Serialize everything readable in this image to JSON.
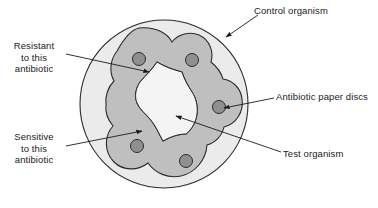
{
  "figure": {
    "background_color": "#ffffff"
  },
  "labels": {
    "resistant": "Resistant\nto this\nantibiotic",
    "sensitive": "Sensitive\nto this\nantibiotic",
    "control_organism": "Control organism",
    "antibiotic_discs": "Antibiotic paper discs",
    "test_organism": "Test organism"
  },
  "colors": {
    "plate_fill": "#ebebeb",
    "lawn_fill": "#bfbfbf",
    "clear_zone_fill": "#f4f4f4",
    "disc_fill": "#8f8f8f",
    "outline": "#2b2b2b",
    "text": "#1b1b1b"
  },
  "plate": {
    "cx": 164,
    "cy": 104,
    "r": 84,
    "stroke_width": 1.1
  },
  "discs": [
    {
      "name": "disc-top-left",
      "cx": 139,
      "cy": 59,
      "r": 6.5
    },
    {
      "name": "disc-top-right",
      "cx": 192,
      "cy": 60,
      "r": 6.5
    },
    {
      "name": "disc-right",
      "cx": 219,
      "cy": 107,
      "r": 6.5
    },
    {
      "name": "disc-bottom-left",
      "cx": 137,
      "cy": 146,
      "r": 6.5
    },
    {
      "name": "disc-bottom-right",
      "cx": 186,
      "cy": 161,
      "r": 6.5
    }
  ],
  "annotations": [
    {
      "name": "resistant",
      "from": [
        66,
        54
      ],
      "to": [
        149,
        72
      ],
      "arrowhead": true
    },
    {
      "name": "sensitive",
      "from": [
        66,
        146
      ],
      "to": [
        142,
        131
      ],
      "arrowhead": true
    },
    {
      "name": "control-organism",
      "from": [
        258,
        15
      ],
      "to": [
        226,
        37
      ],
      "arrowhead": true
    },
    {
      "name": "antibiotic-discs",
      "from": [
        274,
        98
      ],
      "to": [
        224,
        108
      ],
      "arrowhead": true
    },
    {
      "name": "test-organism",
      "from": [
        281,
        152
      ],
      "to": [
        176,
        116
      ],
      "arrowhead": true
    }
  ]
}
